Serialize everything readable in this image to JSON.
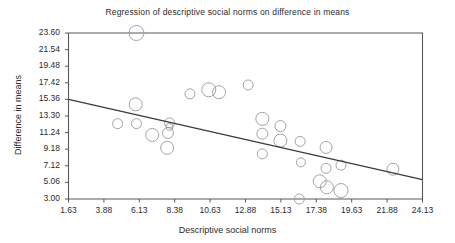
{
  "chart_data": {
    "type": "scatter",
    "title": "Regression of descriptive social norms on difference in means",
    "xlabel": "Descriptive social norms",
    "ylabel": "Difference in means",
    "xlim": [
      1.63,
      24.13
    ],
    "ylim": [
      3.0,
      23.6
    ],
    "grid": false,
    "legend": "none",
    "xticks": [
      "1.63",
      "3.88",
      "6.13",
      "8.38",
      "10.63",
      "12.88",
      "15.13",
      "17.38",
      "19.63",
      "21.88",
      "24.13"
    ],
    "yticks": [
      "23.60",
      "21.54",
      "19.48",
      "17.42",
      "15.36",
      "13.30",
      "11.24",
      "9.18",
      "7.12",
      "5.06",
      "3.00"
    ],
    "xtick_values": [
      1.63,
      3.88,
      6.13,
      8.38,
      10.63,
      12.88,
      15.13,
      17.38,
      19.63,
      21.88,
      24.13
    ],
    "ytick_values": [
      23.6,
      21.54,
      19.48,
      17.42,
      15.36,
      13.3,
      11.24,
      9.18,
      7.12,
      5.06,
      3.0
    ],
    "marker": "open-circle",
    "marker_note": "bubble sizes vary by study weight",
    "series": [
      {
        "name": "studies",
        "points": [
          {
            "x": 5.95,
            "y": 23.6,
            "r": 7.5
          },
          {
            "x": 5.9,
            "y": 14.75,
            "r": 6.5
          },
          {
            "x": 4.75,
            "y": 12.35,
            "r": 5.0
          },
          {
            "x": 5.95,
            "y": 12.35,
            "r": 5.0
          },
          {
            "x": 6.95,
            "y": 10.95,
            "r": 6.5
          },
          {
            "x": 7.95,
            "y": 11.2,
            "r": 5.5
          },
          {
            "x": 8.05,
            "y": 12.45,
            "r": 5.0
          },
          {
            "x": 8.05,
            "y": 11.95,
            "r": 3.5
          },
          {
            "x": 7.9,
            "y": 9.35,
            "r": 6.5
          },
          {
            "x": 9.35,
            "y": 16.05,
            "r": 5.0
          },
          {
            "x": 10.55,
            "y": 16.55,
            "r": 7.0
          },
          {
            "x": 11.2,
            "y": 16.25,
            "r": 6.5
          },
          {
            "x": 13.05,
            "y": 17.15,
            "r": 5.0
          },
          {
            "x": 13.95,
            "y": 12.95,
            "r": 6.5
          },
          {
            "x": 13.95,
            "y": 11.1,
            "r": 5.5
          },
          {
            "x": 13.95,
            "y": 8.6,
            "r": 5.0
          },
          {
            "x": 15.1,
            "y": 12.05,
            "r": 5.5
          },
          {
            "x": 15.1,
            "y": 10.25,
            "r": 6.5
          },
          {
            "x": 16.35,
            "y": 10.15,
            "r": 5.0
          },
          {
            "x": 16.4,
            "y": 7.55,
            "r": 4.5
          },
          {
            "x": 16.3,
            "y": 3.0,
            "r": 5.0
          },
          {
            "x": 17.6,
            "y": 5.2,
            "r": 6.5
          },
          {
            "x": 18.0,
            "y": 9.4,
            "r": 6.0
          },
          {
            "x": 18.0,
            "y": 6.8,
            "r": 5.0
          },
          {
            "x": 18.05,
            "y": 4.45,
            "r": 6.5
          },
          {
            "x": 18.95,
            "y": 7.2,
            "r": 5.0
          },
          {
            "x": 18.95,
            "y": 4.05,
            "r": 7.0
          },
          {
            "x": 22.25,
            "y": 6.7,
            "r": 6.0
          }
        ]
      }
    ],
    "fit_line": {
      "name": "regression-line",
      "x_start": 1.63,
      "y_start": 15.36,
      "x_end": 24.13,
      "y_end": 5.4
    }
  }
}
